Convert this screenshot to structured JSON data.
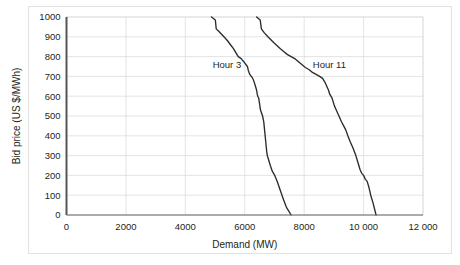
{
  "figure": {
    "background_color": "#ffffff",
    "frame_color": "#e2e2e2",
    "axis_color": "#555555",
    "grid_color": "#d9d9d9",
    "series_color": "#2b2b2b"
  },
  "chart_data": {
    "type": "line",
    "title": "",
    "subtitle": "",
    "xlabel": "Demand (MW)",
    "ylabel": "Bid price (US $/MWh)",
    "xlim": [
      0,
      12000
    ],
    "ylim": [
      0,
      1000
    ],
    "xticks": [
      0,
      2000,
      4000,
      6000,
      8000,
      10000,
      12000
    ],
    "xtick_labels": [
      "0",
      "2000",
      "4000",
      "6000",
      "8000",
      "10 000",
      "12 000"
    ],
    "yticks": [
      0,
      100,
      200,
      300,
      400,
      500,
      600,
      700,
      800,
      900,
      1000
    ],
    "ytick_labels": [
      "0",
      "100",
      "200",
      "300",
      "400",
      "500",
      "600",
      "700",
      "800",
      "900",
      "1000"
    ],
    "grid": {
      "horizontal": true,
      "vertical": true
    },
    "legend": {
      "position": "inline-annotations"
    },
    "annotations": [
      {
        "name": "hour-3-label",
        "text": "Hour 3",
        "x": 5400,
        "y": 740
      },
      {
        "name": "hour-11-label",
        "text": "Hour 11",
        "x": 8850,
        "y": 740
      }
    ],
    "series": [
      {
        "name": "Hour 3",
        "label": "Hour 3",
        "x": [
          4880,
          5010,
          5040,
          5140,
          5300,
          5420,
          5520,
          5620,
          5700,
          5780,
          5880,
          5990,
          6090,
          6120,
          6170,
          6220,
          6270,
          6320,
          6360,
          6400,
          6420,
          6440,
          6470,
          6500,
          6530,
          6600,
          6640,
          6660,
          6680,
          6700,
          6720,
          6740,
          6760,
          6800,
          6860,
          6930,
          7010,
          7090,
          7160,
          7230,
          7300,
          7400,
          7560
        ],
        "y": [
          1000,
          985,
          940,
          925,
          900,
          880,
          860,
          840,
          820,
          800,
          790,
          770,
          750,
          730,
          710,
          700,
          690,
          670,
          650,
          630,
          610,
          600,
          590,
          560,
          530,
          500,
          470,
          440,
          410,
          380,
          350,
          320,
          300,
          280,
          250,
          220,
          200,
          170,
          140,
          110,
          80,
          40,
          0
        ],
        "units_x": "MW",
        "units_y": "US $/MWh"
      },
      {
        "name": "Hour 11",
        "label": "Hour 11",
        "x": [
          6400,
          6520,
          6560,
          6660,
          6780,
          6880,
          6980,
          7090,
          7200,
          7320,
          7440,
          7560,
          7680,
          7800,
          7920,
          8040,
          8160,
          8280,
          8400,
          8520,
          8620,
          8700,
          8760,
          8820,
          8860,
          8900,
          8940,
          8980,
          9020,
          9080,
          9140,
          9200,
          9260,
          9330,
          9400,
          9470,
          9550,
          9640,
          9740,
          9820,
          9880,
          9940,
          10000,
          10060,
          10120,
          10180,
          10240,
          10320,
          10420
        ],
        "y": [
          1000,
          985,
          940,
          920,
          900,
          885,
          870,
          855,
          840,
          825,
          810,
          800,
          790,
          775,
          760,
          745,
          735,
          720,
          710,
          700,
          690,
          670,
          650,
          630,
          610,
          600,
          590,
          570,
          550,
          530,
          510,
          490,
          470,
          450,
          430,
          400,
          370,
          340,
          300,
          260,
          230,
          210,
          200,
          180,
          170,
          140,
          100,
          60,
          0
        ],
        "units_x": "MW",
        "units_y": "US $/MWh"
      }
    ]
  }
}
